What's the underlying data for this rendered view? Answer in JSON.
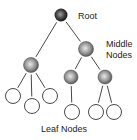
{
  "diagram": {
    "type": "tree",
    "labels": {
      "root": "Root",
      "middle_line1": "Middle",
      "middle_line2": "Nodes",
      "leaf": "Leaf Nodes"
    },
    "colors": {
      "root_fill_center": "#9a9a9a",
      "root_fill_edge": "#111111",
      "middle_fill_center": "#e0e0e0",
      "middle_fill_edge": "#555555",
      "leaf_fill": "#ffffff",
      "stroke": "#333333"
    },
    "nodes": [
      {
        "id": "root",
        "kind": "root",
        "cx": 61,
        "cy": 15,
        "r": 6.5
      },
      {
        "id": "m1",
        "kind": "middle",
        "cx": 86,
        "cy": 49,
        "r": 7.5
      },
      {
        "id": "m2",
        "kind": "middle",
        "cx": 31,
        "cy": 65,
        "r": 7.5
      },
      {
        "id": "m3",
        "kind": "middle",
        "cx": 71,
        "cy": 77,
        "r": 7
      },
      {
        "id": "m4",
        "kind": "middle",
        "cx": 105,
        "cy": 77,
        "r": 7
      },
      {
        "id": "l1",
        "kind": "leaf",
        "cx": 13,
        "cy": 96,
        "r": 7.5
      },
      {
        "id": "l2",
        "kind": "leaf",
        "cx": 32,
        "cy": 106,
        "r": 7.5
      },
      {
        "id": "l3",
        "kind": "leaf",
        "cx": 50,
        "cy": 96,
        "r": 7.5
      },
      {
        "id": "l4",
        "kind": "leaf",
        "cx": 72,
        "cy": 112,
        "r": 7.5
      },
      {
        "id": "l5",
        "kind": "leaf",
        "cx": 96,
        "cy": 112,
        "r": 7.5
      },
      {
        "id": "l6",
        "kind": "leaf",
        "cx": 114,
        "cy": 112,
        "r": 7.5
      }
    ],
    "edges": [
      [
        "root",
        "m2"
      ],
      [
        "root",
        "m1"
      ],
      [
        "m1",
        "m3"
      ],
      [
        "m1",
        "m4"
      ],
      [
        "m2",
        "l1"
      ],
      [
        "m2",
        "l2"
      ],
      [
        "m2",
        "l3"
      ],
      [
        "m3",
        "l4"
      ],
      [
        "m4",
        "l5"
      ],
      [
        "m4",
        "l6"
      ]
    ]
  }
}
